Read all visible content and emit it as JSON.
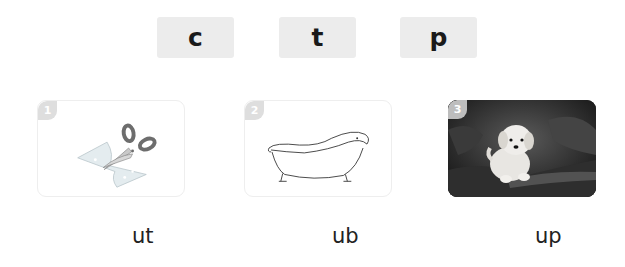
{
  "letters": [
    {
      "label": "c"
    },
    {
      "label": "t"
    },
    {
      "label": "p"
    }
  ],
  "cards": [
    {
      "number": "1",
      "picture": "scissors-cutting-paper"
    },
    {
      "number": "2",
      "picture": "bathtub"
    },
    {
      "number": "3",
      "picture": "puppy"
    }
  ],
  "words": [
    {
      "text": "ut"
    },
    {
      "text": "ub"
    },
    {
      "text": "up"
    }
  ],
  "colors": {
    "letter_box_bg": "#ececec",
    "badge_bg": "#dedede",
    "card_border": "#eeeeee"
  }
}
